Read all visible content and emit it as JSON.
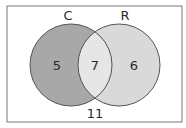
{
  "diagram": {
    "type": "venn",
    "sets": [
      {
        "name": "C",
        "only_value": "5",
        "color": "#a8a8a8"
      },
      {
        "name": "R",
        "only_value": "6",
        "color": "#d9d9d9"
      }
    ],
    "intersection_value": "7",
    "outside_value": "11",
    "intersection_color": "#e6e6e6",
    "outline_color": "#555555",
    "frame_color": "#777777"
  }
}
